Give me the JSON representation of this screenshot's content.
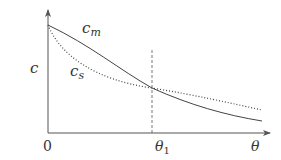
{
  "diagram": {
    "y_axis_label": "c",
    "x_axis_label": "θ",
    "origin_label": "0",
    "marker_label": "θ",
    "marker_subscript": "1",
    "curves": [
      {
        "name": "c_m",
        "base": "c",
        "subscript": "m",
        "style": "solid"
      },
      {
        "name": "c_s",
        "base": "c",
        "subscript": "s",
        "style": "dotted"
      }
    ],
    "colors": {
      "axis": "#555555",
      "curve": "#444444",
      "text": "#333333"
    }
  }
}
